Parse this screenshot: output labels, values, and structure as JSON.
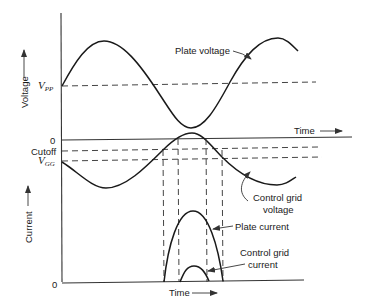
{
  "diagram": {
    "type": "waveform-diagram",
    "upper_panel": {
      "y_axis_label": "Voltage",
      "x_axis_label": "Time",
      "levels": {
        "vpp": {
          "symbol": "V",
          "subscript": "PP"
        },
        "zero": "0",
        "cutoff": "Cutoff",
        "vgg": {
          "symbol": "V",
          "subscript": "GG"
        }
      },
      "curves": {
        "plate_voltage": "Plate voltage",
        "control_grid_voltage_line1": "Control grid",
        "control_grid_voltage_line2": "voltage"
      }
    },
    "lower_panel": {
      "y_axis_label": "Current",
      "x_axis_label": "Time",
      "zero": "0",
      "curves": {
        "plate_current": "Plate current",
        "control_grid_current_line1": "Control grid",
        "control_grid_current_line2": "current"
      }
    },
    "colors": {
      "ink": "#1a1a1a",
      "background": "#ffffff"
    }
  }
}
